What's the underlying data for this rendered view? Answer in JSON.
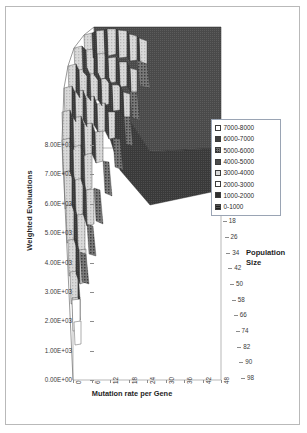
{
  "chart_data": {
    "type": "surface",
    "title": "",
    "xlabel": "Mutation rate per Gene",
    "ylabel": "Weighted Evaluations",
    "zlabel": "Population Size",
    "grid": false,
    "legend_position": "right",
    "x_ticks": [
      "0",
      "6",
      "12",
      "18",
      "24",
      "30",
      "36",
      "42",
      "48"
    ],
    "y_ticks": [
      "8.00E+03",
      "7.00E+03",
      "6.00E+03",
      "5.00E+03",
      "4.00E+03",
      "3.00E+03",
      "2.00E+03",
      "1.00E+03",
      "0.00E+00"
    ],
    "ylim": [
      0,
      8000
    ],
    "z_ticks": [
      "2",
      "10",
      "18",
      "26",
      "34",
      "42",
      "50",
      "58",
      "66",
      "74",
      "82",
      "90",
      "98"
    ],
    "legend": [
      {
        "label": "7000-8000",
        "swatch": "sw-7000",
        "color": "#ffffff"
      },
      {
        "label": "6000-7000",
        "swatch": "sw-6000",
        "color": "#3f3f3f"
      },
      {
        "label": "5000-6000",
        "swatch": "sw-5000",
        "color": "#6e6e6e"
      },
      {
        "label": "4000-5000",
        "swatch": "sw-4000",
        "color": "#4c4c4c"
      },
      {
        "label": "3000-4000",
        "swatch": "sw-3000",
        "color": "#d8d8d8"
      },
      {
        "label": "2000-3000",
        "swatch": "sw-2000",
        "color": "#ffffff"
      },
      {
        "label": "1000-2000",
        "swatch": "sw-1000",
        "color": "#2f2f2f"
      },
      {
        "label": "0-1000",
        "swatch": "sw-0",
        "color": "#555555"
      }
    ],
    "plateau_value": 6500,
    "peak_value": 7800,
    "min_value": 0
  },
  "axes": {
    "y_title": "Weighted Evaluations",
    "x_title": "Mutation rate per Gene",
    "z_title_line1": "Population",
    "z_title_line2": "Size"
  },
  "colors": {
    "frame": "#b9b9b9",
    "plateau": "#4a4a4a",
    "peak": "#d6d6d6",
    "axis_text": "#3a3a3a"
  }
}
